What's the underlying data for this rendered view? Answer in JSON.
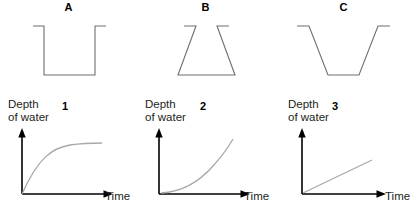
{
  "figure": {
    "panels": [
      {
        "container_label": "A",
        "container_shape": "straight-sided cylinder",
        "graph_number": "1",
        "y_axis_label_line1": "Depth",
        "y_axis_label_line2": "of water",
        "x_axis_label": "Time",
        "curve_type": "concave-down increasing"
      },
      {
        "container_label": "B",
        "container_shape": "trapezoid narrow top wide bottom",
        "graph_number": "2",
        "y_axis_label_line1": "Depth",
        "y_axis_label_line2": "of water",
        "x_axis_label": "Time",
        "curve_type": "concave-up increasing"
      },
      {
        "container_label": "C",
        "container_shape": "inverted trapezoid wide top narrow bottom",
        "graph_number": "3",
        "y_axis_label_line1": "Depth",
        "y_axis_label_line2": "of water",
        "x_axis_label": "Time",
        "curve_type": "linear increasing"
      }
    ]
  },
  "colors": {
    "background": "#ffffff",
    "vessel_stroke": "#6e6e6e",
    "axis_stroke": "#000000",
    "curve_stroke": "#a8a8a8",
    "text": "#231f20"
  }
}
